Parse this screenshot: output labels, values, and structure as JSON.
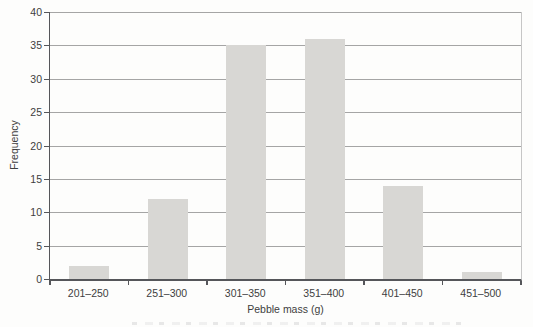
{
  "chart_data": {
    "type": "bar",
    "title": "",
    "categories": [
      "201–250",
      "251–300",
      "301–350",
      "351–400",
      "401–450",
      "451–500"
    ],
    "values": [
      2,
      12,
      35,
      36,
      14,
      1
    ],
    "xlabel": "Pebble mass (g)",
    "ylabel": "Frequency",
    "ylim": [
      0,
      40
    ],
    "ytick_step": 5,
    "yticks": [
      0,
      5,
      10,
      15,
      20,
      25,
      30,
      35,
      40
    ],
    "grid": true,
    "legend_position": "none"
  },
  "style": {
    "background": "#fdfdfc",
    "bar_color": "#d8d7d4",
    "gridline_color": "#a5a5a5",
    "axis_color": "#55565a",
    "right_border_color": "#c6c6c6",
    "text_color": "#3e3e40"
  }
}
